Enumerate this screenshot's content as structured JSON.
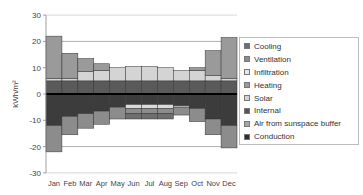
{
  "chart_data": {
    "type": "bar",
    "stacked": true,
    "title": "",
    "xlabel": "",
    "ylabel": "kWh/m²",
    "ylim": [
      -30,
      30
    ],
    "yticks": [
      30,
      20,
      10,
      0,
      -10,
      -20,
      -30
    ],
    "grid": "horizontal major gridlines at ±20",
    "legend_position": "right",
    "categories": [
      "Jan",
      "Feb",
      "Mar",
      "Apr",
      "May",
      "Jun",
      "Jul",
      "Aug",
      "Sep",
      "Oct",
      "Nov",
      "Dec"
    ],
    "series": [
      {
        "name": "Internal",
        "color": "#5a5a5a",
        "values": [
          5,
          5,
          5,
          5,
          5,
          5,
          5,
          5,
          5,
          5,
          5,
          5
        ]
      },
      {
        "name": "Solar",
        "color": "#d4d4d4",
        "values": [
          1,
          1,
          3.5,
          4,
          5,
          5.5,
          5.5,
          5,
          4,
          4,
          2,
          1
        ]
      },
      {
        "name": "Heating",
        "color": "#9a9a9a",
        "values": [
          16,
          9.5,
          5,
          2.5,
          0,
          0,
          0,
          0,
          0,
          1,
          9.5,
          15.5
        ]
      },
      {
        "name": "Conduction",
        "color": "#3c3c3c",
        "values": [
          -12,
          -8.5,
          -7.5,
          -6.5,
          -5,
          -4,
          -4,
          -4,
          -4.5,
          -5.5,
          -9.5,
          -12
        ]
      },
      {
        "name": "Infiltration",
        "color": "#d9d9d9",
        "values": [
          0,
          0,
          0,
          0,
          0,
          -1.5,
          -1.5,
          -1.5,
          -0.5,
          0,
          0,
          0
        ]
      },
      {
        "name": "Ventilation",
        "color": "#8c8c8c",
        "values": [
          -10,
          -7,
          -5.5,
          -5,
          -4.5,
          -2,
          -2,
          -2,
          -3,
          -5,
          -6,
          -8.5
        ]
      },
      {
        "name": "Cooling",
        "color": "#6e6e6e",
        "values": [
          0,
          0,
          0,
          0,
          0,
          -2,
          -2,
          -2,
          0,
          0,
          0,
          0
        ]
      },
      {
        "name": "Air from sunspace buffer",
        "color": "#a6a6a6",
        "values": [
          0,
          0,
          0,
          0,
          0,
          0,
          0,
          0,
          0,
          0,
          0,
          0
        ]
      }
    ]
  },
  "legend": {
    "items": [
      {
        "label": "Cooling",
        "color": "#6e6e6e"
      },
      {
        "label": "Ventilation",
        "color": "#8c8c8c"
      },
      {
        "label": "Infiltration",
        "color": "#e6e6e6"
      },
      {
        "label": "Heating",
        "color": "#9a9a9a"
      },
      {
        "label": "Solar",
        "color": "#d4d4d4"
      },
      {
        "label": "Internal",
        "color": "#555555"
      },
      {
        "label": "Air from sunspace buffer",
        "color": "#a6a6a6"
      },
      {
        "label": "Conduction",
        "color": "#2e2e2e"
      }
    ]
  },
  "axis": {
    "ylabel": "kWh/m²",
    "yticks": [
      "30",
      "20",
      "10",
      "0",
      "-10",
      "-20",
      "-30"
    ],
    "months": [
      "Jan",
      "Feb",
      "Mar",
      "Apr",
      "May",
      "Jun",
      "Jul",
      "Aug",
      "Sep",
      "Oct",
      "Nov",
      "Dec"
    ]
  }
}
